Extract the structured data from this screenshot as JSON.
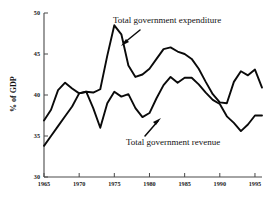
{
  "chart_data": {
    "type": "line",
    "title": "",
    "xlabel": "",
    "ylabel": "% of GDP",
    "xlim": [
      1965,
      1996
    ],
    "ylim": [
      30,
      50
    ],
    "grid": false,
    "legend_position": "inline-annotations",
    "xticks": [
      1965,
      1970,
      1975,
      1980,
      1985,
      1990,
      1995
    ],
    "yticks": [
      30,
      35,
      40,
      45,
      50
    ],
    "x": [
      1965,
      1966,
      1967,
      1968,
      1969,
      1970,
      1971,
      1972,
      1973,
      1974,
      1975,
      1976,
      1977,
      1978,
      1979,
      1980,
      1981,
      1982,
      1983,
      1984,
      1985,
      1986,
      1987,
      1988,
      1989,
      1990,
      1991,
      1992,
      1993,
      1994,
      1995,
      1996
    ],
    "series": [
      {
        "name": "Total government expenditure",
        "values": [
          36.9,
          38.2,
          40.6,
          41.5,
          40.8,
          40.2,
          40.4,
          40.3,
          40.7,
          44.8,
          48.5,
          47.4,
          43.6,
          42.2,
          42.5,
          43.2,
          44.4,
          45.6,
          45.8,
          45.3,
          45.0,
          44.4,
          43.2,
          41.6,
          40.1,
          39.1,
          39.0,
          41.6,
          42.9,
          42.4,
          43.1,
          40.9
        ]
      },
      {
        "name": "Total government revenue",
        "values": [
          33.8,
          35.0,
          36.2,
          37.4,
          38.6,
          40.2,
          40.4,
          38.4,
          36.0,
          39.0,
          40.4,
          39.8,
          40.1,
          38.4,
          37.3,
          37.8,
          39.6,
          41.2,
          42.2,
          41.5,
          42.1,
          42.1,
          41.3,
          40.3,
          39.4,
          38.9,
          37.4,
          36.6,
          35.6,
          36.4,
          37.5,
          37.5
        ]
      }
    ],
    "annotations": [
      {
        "text": "Total government expenditure",
        "points_to_series": "Total government expenditure"
      },
      {
        "text": "Total government revenue",
        "points_to_series": "Total government revenue"
      }
    ]
  }
}
